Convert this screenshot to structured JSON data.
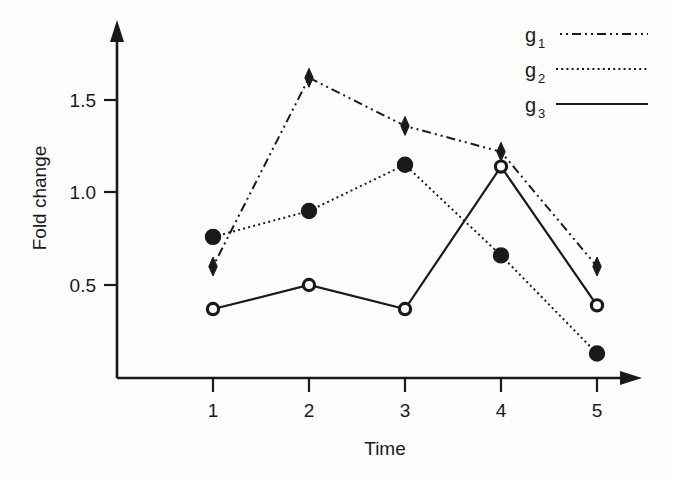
{
  "chart_data": {
    "type": "line",
    "title": "",
    "subtitle": "",
    "xlabel": "Time",
    "ylabel": "Fold change",
    "x": [
      1,
      2,
      3,
      4,
      5
    ],
    "categories": [
      "1",
      "2",
      "3",
      "4",
      "5"
    ],
    "xtick_labels": [
      "1",
      "2",
      "3",
      "4",
      "5"
    ],
    "ytick_labels": [
      "0.5",
      "1.0",
      "1.5"
    ],
    "yticks": [
      0.5,
      1.0,
      1.5
    ],
    "xlim": [
      0.62,
      5.35
    ],
    "ylim": [
      0.0,
      1.78
    ],
    "grid": false,
    "legend_position": "top-right",
    "series": [
      {
        "name": "g1",
        "legend_label": "g",
        "legend_sub": "1",
        "style": "dash-dot",
        "marker": "diamond",
        "values": [
          0.6,
          1.62,
          1.36,
          1.22,
          0.6
        ]
      },
      {
        "name": "g2",
        "legend_label": "g",
        "legend_sub": "2",
        "style": "dotted",
        "marker": "filled-circle",
        "values": [
          0.76,
          0.9,
          1.15,
          0.66,
          0.13
        ]
      },
      {
        "name": "g3",
        "legend_label": "g",
        "legend_sub": "3",
        "style": "solid",
        "marker": "open-circle",
        "values": [
          0.37,
          0.5,
          0.37,
          1.14,
          0.39
        ]
      }
    ],
    "colors": {
      "ink": "#1a1a1a",
      "background": "#fdfdfd",
      "marker_fill_open": "#ffffff"
    }
  },
  "axes": {
    "x_axis_name": "Time",
    "y_axis_name": "Fold change"
  }
}
